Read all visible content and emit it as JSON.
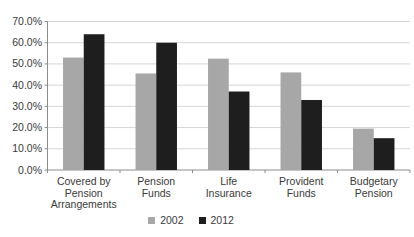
{
  "chart_data": {
    "type": "bar",
    "title": "",
    "xlabel": "",
    "ylabel": "",
    "categories": [
      {
        "label": "Covered by Pension Arrangements",
        "lines": [
          "Covered by",
          "Pension",
          "Arrangements"
        ]
      },
      {
        "label": "Pension Funds",
        "lines": [
          "Pension",
          "Funds"
        ]
      },
      {
        "label": "Life Insurance",
        "lines": [
          "Life",
          "Insurance"
        ]
      },
      {
        "label": "Provident Funds",
        "lines": [
          "Provident",
          "Funds"
        ]
      },
      {
        "label": "Budgetary Pension",
        "lines": [
          "Budgetary",
          "Pension"
        ]
      }
    ],
    "series": [
      {
        "name": "2002",
        "color": "#A7A7A7",
        "values": [
          53,
          45.5,
          52.5,
          46,
          19.5
        ]
      },
      {
        "name": "2012",
        "color": "#1E1E1E",
        "values": [
          64,
          60,
          37,
          33,
          15
        ]
      }
    ],
    "value_unit": "percent",
    "ylim": [
      0,
      70
    ],
    "ytick_step": 10,
    "ytick_labels": [
      "0.0%",
      "10.0%",
      "20.0%",
      "30.0%",
      "40.0%",
      "50.0%",
      "60.0%",
      "70.0%"
    ],
    "grid": true,
    "legend_position": "bottom-center",
    "colors": {
      "gridline": "#D6D6D6",
      "axis": "#8C8C8C",
      "text": "#3A3A3A",
      "background": "#FFFFFF"
    }
  }
}
